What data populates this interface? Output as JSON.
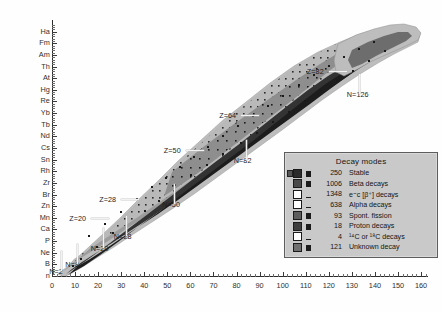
{
  "chart_data": {
    "type": "heatmap",
    "title": "",
    "xlabel": "",
    "ylabel": "",
    "xlim": [
      0,
      163
    ],
    "ylim": [
      0,
      110
    ],
    "grid": false,
    "x_ticks": [
      0,
      10,
      20,
      30,
      40,
      50,
      60,
      70,
      80,
      90,
      100,
      110,
      120,
      130,
      140,
      150,
      160
    ],
    "x_tick_labels": [
      "0",
      "10",
      "20",
      "30",
      "40",
      "50",
      "60",
      "70",
      "80",
      "90",
      "100",
      "110",
      "120",
      "130",
      "140",
      "150",
      "160"
    ],
    "x_minor_step": 2,
    "y_tick_labels": [
      "Ha",
      "Fm",
      "Am",
      "Th",
      "At",
      "Hg",
      "Re",
      "Yb",
      "Tb",
      "Nd",
      "Cs",
      "Sn",
      "Rh",
      "Zr",
      "Br",
      "Zn",
      "Mn",
      "Ca",
      "P",
      "Ne",
      "B",
      "n"
    ],
    "y_tick_values": [
      105,
      100,
      95,
      90,
      85,
      80,
      75,
      70,
      65,
      60,
      55,
      50,
      45,
      40,
      35,
      30,
      25,
      20,
      15,
      10,
      5,
      0
    ],
    "annotations": [
      {
        "text": "Z=82",
        "x": 120,
        "y": 88
      },
      {
        "text": "Z=64",
        "x": 82,
        "y": 69
      },
      {
        "text": "Z=50",
        "x": 58,
        "y": 54
      },
      {
        "text": "Z=28",
        "x": 30,
        "y": 33
      },
      {
        "text": "Z=20",
        "x": 17,
        "y": 25
      },
      {
        "text": "N=126",
        "x": 133,
        "y": 78
      },
      {
        "text": "N=82",
        "x": 84,
        "y": 50
      },
      {
        "text": "N=50",
        "x": 53,
        "y": 31
      },
      {
        "text": "N=28",
        "x": 32,
        "y": 17
      },
      {
        "text": "N=20",
        "x": 22,
        "y": 12
      },
      {
        "text": "N=8",
        "x": 11,
        "y": 5
      },
      {
        "text": "N=2",
        "x": 4,
        "y": 2
      }
    ],
    "legend": {
      "title": "Decay modes",
      "position": "lower-right-inside",
      "total_nuclides": 3578,
      "entries": [
        {
          "label": "Stable",
          "count": 250,
          "color": "#2b2b2b",
          "fill": "dark"
        },
        {
          "label": "Beta decays",
          "count": 1006,
          "color": "#4a4a4a",
          "fill": "dark"
        },
        {
          "label": "e⁼c [β⁺] decays",
          "count": 1348,
          "color": "#ffffff",
          "fill": "light"
        },
        {
          "label": "Alpha decays",
          "count": 638,
          "color": "#ffffff",
          "fill": "light"
        },
        {
          "label": "Spont. fission",
          "count": 93,
          "color": "#5e5e5e",
          "fill": "dark"
        },
        {
          "label": "Proton decays",
          "count": 18,
          "color": "#3d3d3d",
          "fill": "dark"
        },
        {
          "label": "¹⁴C or ¹⁸C decays",
          "count": 4,
          "color": "#ffffff",
          "fill": "light"
        },
        {
          "label": "Unknown decay",
          "count": 121,
          "color": "#6f6f6f",
          "fill": "dark"
        }
      ]
    },
    "colors": {
      "background": "#ffffff",
      "axis": "#2b2b2b",
      "band_light": "#b9b9b9",
      "band_mid": "#8a8a8a",
      "band_dark": "#3a3a3a",
      "band_black": "#1c1c1c",
      "legend_bg": "#c9c9c9",
      "legend_border": "#5d5d5d"
    }
  }
}
